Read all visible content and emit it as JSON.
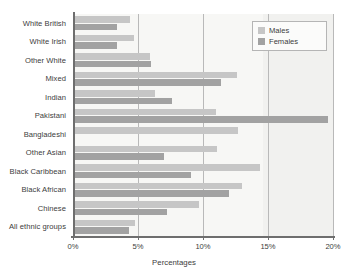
{
  "chart_data": {
    "type": "bar",
    "orientation": "horizontal",
    "title": "",
    "xlabel": "Percentages",
    "ylabel": "",
    "xlim": [
      0,
      20
    ],
    "grid": true,
    "legend_position": "top-right",
    "categories": [
      "White British",
      "White Irish",
      "Other White",
      "Mixed",
      "Indian",
      "Pakistani",
      "Bangladeshi",
      "Other Asian",
      "Black Caribbean",
      "Black African",
      "Chinese",
      "All ethnic groups"
    ],
    "series": [
      {
        "name": "Males",
        "color": "#c6c6c6",
        "values": [
          4.4,
          4.7,
          5.9,
          12.6,
          6.3,
          11.0,
          12.7,
          11.1,
          14.4,
          13.0,
          9.7,
          4.8
        ]
      },
      {
        "name": "Females",
        "color": "#a2a2a2",
        "values": [
          3.4,
          3.4,
          6.0,
          11.4,
          7.6,
          19.6,
          0.0,
          7.0,
          9.1,
          12.0,
          7.2,
          4.3
        ]
      }
    ],
    "xticks": [
      {
        "value": 0,
        "label": "0%"
      },
      {
        "value": 5,
        "label": "5%"
      },
      {
        "value": 10,
        "label": "10%"
      },
      {
        "value": 15,
        "label": "15%"
      },
      {
        "value": 20,
        "label": "20%"
      }
    ]
  },
  "legend": {
    "items": [
      {
        "label": "Males",
        "key": "males"
      },
      {
        "label": "Females",
        "key": "females"
      }
    ]
  },
  "colors": {
    "males": "#c6c6c6",
    "females": "#a2a2a2",
    "plot_background": "#f7f7f5",
    "axis": "#6e6e6e",
    "gridline": "#b9b9b9"
  }
}
